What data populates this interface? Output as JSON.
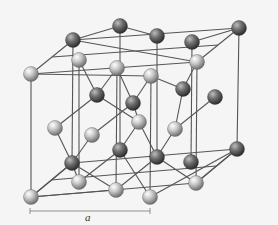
{
  "diagram": {
    "type": "crystal-lattice",
    "colors": {
      "background": "#f5f5f5",
      "bond": "#555555",
      "light_atom": "#c4c4c4",
      "dark_atom": "#6e6e6e"
    },
    "scale_label": "a",
    "scale_bar": {
      "x1": 30,
      "x2": 150,
      "y": 211
    }
  }
}
